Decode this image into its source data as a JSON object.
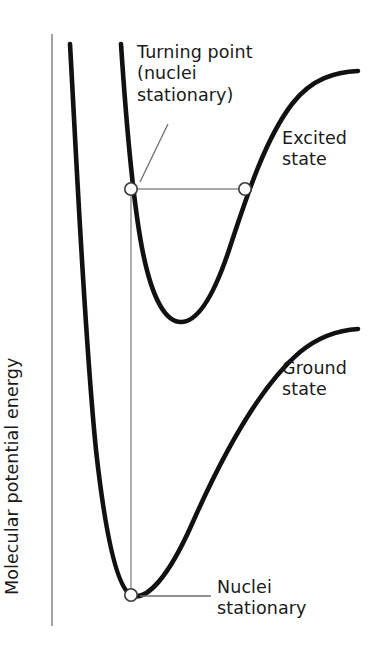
{
  "figure": {
    "kind": "potential-energy-curve-diagram",
    "background_color": "#ffffff",
    "width": 376,
    "height": 661
  },
  "axis": {
    "y_label": "Molecular potential energy",
    "line_color": "#8c8c8c"
  },
  "labels": {
    "turning_point": "Turning point\n(nuclei\nstationary)",
    "excited_state": "Excited\nstate",
    "ground_state": "Ground\nstate",
    "nuclei_stationary": "Nuclei\nstationary"
  },
  "colors": {
    "curve": "#111111",
    "axis": "#8c8c8c",
    "leader": "#6e6e6e",
    "transition_line": "#8c8c8c",
    "marker_fill": "#ffffff",
    "marker_stroke": "#3a3a3a",
    "text": "#1a1a1a"
  },
  "chart_data": {
    "type": "line",
    "title": "",
    "xlabel": "",
    "ylabel": "Molecular potential energy",
    "grid": false,
    "legend": "inline-annotations",
    "series": [
      {
        "name": "Ground state",
        "description": "Morse potential, lower electronic state",
        "path": "M 70,44 C 76,150 84,330 96,450 C 106,540 118,588 131,595 C 146,602 168,578 192,524 C 222,456 258,388 300,352 C 322,334 342,330 358,329"
      },
      {
        "name": "Excited state",
        "description": "Morse potential, upper electronic state, displaced to larger internuclear separation",
        "path": "M 121,44 C 126,120 132,195 142,248 C 152,300 166,322 181,322 C 198,322 214,296 230,247 C 248,192 266,138 292,104 C 312,78 336,72 358,71"
      }
    ],
    "markers": [
      {
        "name": "excited-state-left-turning-point",
        "x": 131,
        "y": 189,
        "label": "Turning point (nuclei stationary)"
      },
      {
        "name": "excited-state-right-turning-point",
        "x": 245,
        "y": 189,
        "label": ""
      },
      {
        "name": "ground-state-minimum",
        "x": 131,
        "y": 595,
        "label": "Nuclei stationary"
      }
    ],
    "connectors": [
      {
        "name": "vertical-transition",
        "from": [
          131,
          189
        ],
        "to": [
          131,
          595
        ],
        "style": "thin-vertical"
      },
      {
        "name": "turning-point-level",
        "from": [
          131,
          189
        ],
        "to": [
          245,
          189
        ],
        "style": "thin-horizontal"
      }
    ]
  }
}
